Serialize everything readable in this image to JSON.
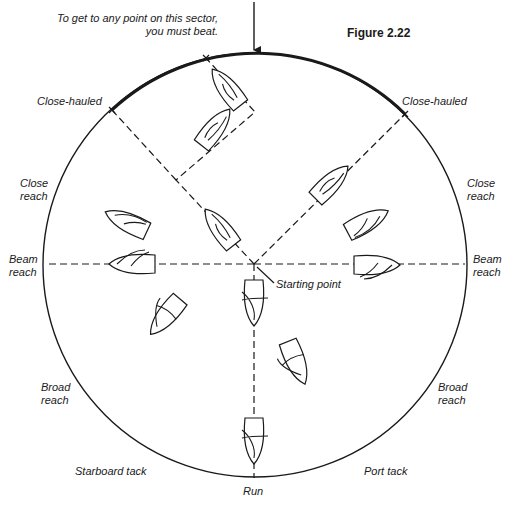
{
  "figure": {
    "title": "Figure 2.22",
    "caption_line1": "To get to any point on this sector,",
    "caption_line2": "you must beat.",
    "center_label": "Starting point",
    "colors": {
      "ink": "#1a1a1a",
      "background": "#ffffff"
    }
  },
  "labels": {
    "close_hauled_left": "Close-hauled",
    "close_hauled_right": "Close-hauled",
    "close_reach_left_1": "Close",
    "close_reach_left_2": "reach",
    "close_reach_right_1": "Close",
    "close_reach_right_2": "reach",
    "beam_reach_left_1": "Beam",
    "beam_reach_left_2": "reach",
    "beam_reach_right_1": "Beam",
    "beam_reach_right_2": "reach",
    "broad_reach_left_1": "Broad",
    "broad_reach_left_2": "reach",
    "broad_reach_right_1": "Broad",
    "broad_reach_right_2": "reach",
    "starboard_tack": "Starboard tack",
    "port_tack": "Port tack",
    "run": "Run"
  },
  "diagram": {
    "circle": {
      "cx": 255,
      "cy": 265,
      "r": 212
    },
    "beat_sector": {
      "from": [
        112,
        110
      ],
      "to": [
        405,
        114
      ]
    },
    "wind_arrow": {
      "x": 254,
      "y1": 2,
      "y2": 50
    },
    "courses": [
      {
        "name": "beat-zigzag",
        "points": [
          [
            254,
            264
          ],
          [
            176,
            180
          ],
          [
            255,
            112
          ],
          [
            206,
            58
          ]
        ]
      },
      {
        "name": "close-hauled-right",
        "points": [
          [
            254,
            264
          ],
          [
            405,
            114
          ]
        ]
      },
      {
        "name": "close-hauled-left",
        "points": [
          [
            176,
            180
          ],
          [
            112,
            110
          ]
        ]
      },
      {
        "name": "beam-reach-left",
        "points": [
          [
            254,
            264
          ],
          [
            45,
            264
          ]
        ]
      },
      {
        "name": "beam-reach-right",
        "points": [
          [
            254,
            264
          ],
          [
            465,
            264
          ]
        ]
      },
      {
        "name": "run",
        "points": [
          [
            254,
            264
          ],
          [
            254,
            478
          ]
        ]
      }
    ],
    "boats": [
      {
        "name": "boat-beat-1",
        "x": 227,
        "y": 88,
        "rot": -38,
        "sail": "close"
      },
      {
        "name": "boat-beat-2",
        "x": 215,
        "y": 128,
        "rot": 38,
        "sail": "close"
      },
      {
        "name": "boat-beat-3",
        "x": 220,
        "y": 228,
        "rot": -38,
        "sail": "close"
      },
      {
        "name": "boat-close-hauled-right",
        "x": 331,
        "y": 183,
        "rot": 45,
        "sail": "close"
      },
      {
        "name": "boat-close-reach-right",
        "x": 367,
        "y": 222,
        "rot": 62,
        "sail": "reach"
      },
      {
        "name": "boat-close-reach-left",
        "x": 127,
        "y": 222,
        "rot": -65,
        "sail": "reach"
      },
      {
        "name": "boat-beam-reach-left",
        "x": 133,
        "y": 264,
        "rot": -90,
        "sail": "beam"
      },
      {
        "name": "boat-beam-reach-right",
        "x": 376,
        "y": 265,
        "rot": 90,
        "sail": "beam"
      },
      {
        "name": "boat-broad-reach-left",
        "x": 166,
        "y": 316,
        "rot": -140,
        "sail": "broad"
      },
      {
        "name": "boat-broad-reach-right",
        "x": 296,
        "y": 362,
        "rot": 158,
        "sail": "broad"
      },
      {
        "name": "boat-run-1",
        "x": 254,
        "y": 302,
        "rot": 180,
        "sail": "run"
      },
      {
        "name": "boat-run-2",
        "x": 254,
        "y": 440,
        "rot": 180,
        "sail": "run"
      }
    ]
  }
}
